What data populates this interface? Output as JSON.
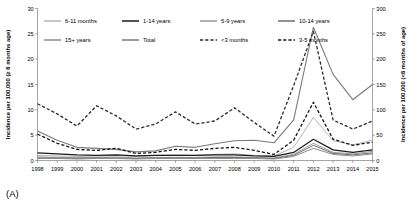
{
  "panel": {
    "label": "(A)"
  },
  "chart_data": {
    "type": "line",
    "title": "",
    "xlabel": "",
    "ylabel": "Incidence per 100,000 (≥ 6 months age)",
    "y2label": "Incidence per 100,000 (<6 months of age)",
    "x": [
      1998,
      1999,
      2000,
      2001,
      2002,
      2003,
      2004,
      2005,
      2006,
      2007,
      2008,
      2009,
      2010,
      2011,
      2012,
      2013,
      2014,
      2015
    ],
    "xticklabels": [
      "1998",
      "1999",
      "2000",
      "2001",
      "2002",
      "2003",
      "2004",
      "2005",
      "2006",
      "2007",
      "2008",
      "2009",
      "2010",
      "2011",
      "2012",
      "2013",
      "2014",
      "2015"
    ],
    "ylim": [
      0,
      30
    ],
    "yticks": [
      0,
      5,
      10,
      15,
      20,
      25,
      30
    ],
    "yticklabels": [
      "0",
      "5",
      "10",
      "15",
      "20",
      "25",
      "30"
    ],
    "y2lim": [
      0,
      300
    ],
    "y2ticks": [
      0,
      50,
      100,
      150,
      200,
      250,
      300
    ],
    "y2ticklabels": [
      "0",
      "50",
      "100",
      "150",
      "200",
      "250",
      "300"
    ],
    "grid": false,
    "legend_position": "top",
    "series": [
      {
        "name": "6-11 months",
        "axis": "left",
        "style": "solid",
        "color": "#b5b5b5",
        "width": 1.0,
        "values": [
          1.0,
          0.9,
          0.8,
          0.9,
          1.0,
          0.8,
          1.0,
          1.1,
          1.0,
          1.2,
          1.3,
          1.0,
          0.9,
          2.6,
          8.5,
          3.9,
          3.1,
          4.0
        ]
      },
      {
        "name": "1-14 years",
        "axis": "left",
        "style": "solid",
        "color": "#1a1a1a",
        "width": 1.2,
        "values": [
          1.5,
          1.3,
          1.1,
          1.0,
          1.1,
          0.9,
          1.0,
          1.0,
          1.0,
          1.1,
          1.1,
          0.9,
          0.8,
          1.6,
          4.2,
          2.1,
          1.6,
          2.1
        ]
      },
      {
        "name": "5-9 years",
        "axis": "left",
        "style": "solid",
        "color": "#9a9a9a",
        "width": 1.0,
        "values": [
          0.7,
          0.6,
          0.6,
          0.6,
          0.7,
          0.5,
          0.6,
          0.6,
          0.6,
          0.7,
          0.7,
          0.6,
          0.5,
          1.2,
          3.4,
          1.6,
          1.3,
          1.8
        ]
      },
      {
        "name": "10-14 years",
        "axis": "left",
        "style": "solid",
        "color": "#6e6e6e",
        "width": 1.0,
        "values": [
          0.5,
          0.5,
          0.4,
          0.5,
          0.5,
          0.4,
          0.5,
          0.5,
          0.5,
          0.6,
          0.6,
          0.5,
          0.4,
          1.0,
          3.0,
          1.4,
          1.1,
          1.5
        ]
      },
      {
        "name": "15+ years",
        "axis": "left",
        "style": "solid",
        "color": "#8c8c8c",
        "width": 1.0,
        "values": [
          0.4,
          0.4,
          0.3,
          0.4,
          0.4,
          0.3,
          0.4,
          0.4,
          0.4,
          0.4,
          0.4,
          0.4,
          0.3,
          0.8,
          2.4,
          1.2,
          0.9,
          1.3
        ]
      },
      {
        "name": "Total",
        "axis": "left",
        "style": "solid",
        "color": "#7a7a7a",
        "width": 1.1,
        "values": [
          5.8,
          4.0,
          2.6,
          2.4,
          2.2,
          1.7,
          1.9,
          2.8,
          2.6,
          3.3,
          3.9,
          4.0,
          3.5,
          8.0,
          26.3,
          17.0,
          12.0,
          15.0
        ]
      },
      {
        "name": "<3 months",
        "axis": "right",
        "style": "dashed",
        "color": "#2b2b2b",
        "width": 1.3,
        "values": [
          112,
          92,
          68,
          108,
          88,
          62,
          72,
          96,
          72,
          78,
          104,
          75,
          48,
          148,
          255,
          80,
          62,
          78
        ]
      },
      {
        "name": "3-5 months",
        "axis": "right",
        "style": "dashed",
        "color": "#141414",
        "width": 1.3,
        "values": [
          52,
          34,
          22,
          20,
          24,
          14,
          16,
          22,
          20,
          24,
          26,
          20,
          12,
          40,
          115,
          42,
          30,
          36
        ]
      }
    ]
  },
  "legend": {
    "items": [
      {
        "label": "6-11 months"
      },
      {
        "label": "1-14 years"
      },
      {
        "label": "5-9 years"
      },
      {
        "label": "10-14 years"
      },
      {
        "label": "15+ years"
      },
      {
        "label": "Total"
      },
      {
        "label": "<3 months"
      },
      {
        "label": "3-5 months"
      }
    ]
  }
}
